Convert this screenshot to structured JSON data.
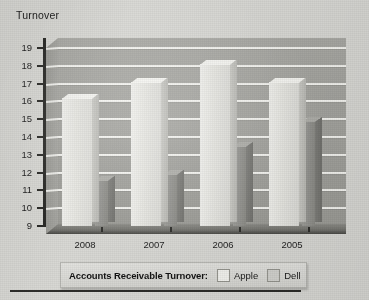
{
  "chart": {
    "y_axis_title": "Turnover",
    "y_ticks": [
      "19",
      "18",
      "17",
      "16",
      "15",
      "14",
      "13",
      "12",
      "11",
      "10",
      "9"
    ],
    "x_ticks": [
      "2008",
      "2007",
      "2006",
      "2005"
    ]
  },
  "legend": {
    "title": "Accounts Receivable Turnover:",
    "entries": [
      {
        "name": "Apple",
        "color": "#f2f2ee"
      },
      {
        "name": "Dell",
        "color": "#d2d2ce"
      }
    ]
  },
  "chart_data": {
    "type": "bar",
    "title": "Accounts Receivable Turnover",
    "xlabel": "",
    "ylabel": "Turnover",
    "ylim": [
      9,
      19
    ],
    "yticks": [
      9,
      10,
      11,
      12,
      13,
      14,
      15,
      16,
      17,
      18,
      19
    ],
    "grid": true,
    "legend_position": "bottom",
    "style": "3d-grouped-bars",
    "categories": [
      "2008",
      "2007",
      "2006",
      "2005"
    ],
    "series": [
      {
        "name": "Apple",
        "color": "#f2f2ee",
        "values": [
          16.2,
          17.1,
          18.1,
          17.1
        ]
      },
      {
        "name": "Dell",
        "color": "#94948f",
        "values": [
          11.6,
          11.95,
          13.5,
          14.9
        ]
      }
    ]
  }
}
